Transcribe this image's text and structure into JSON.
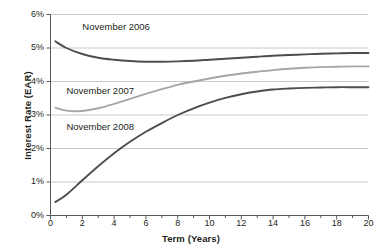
{
  "chart_data": {
    "type": "line",
    "title": "",
    "xlabel": "Term (Years)",
    "ylabel": "Interest Rate (EAR)",
    "xlim": [
      0,
      20
    ],
    "ylim": [
      0,
      6
    ],
    "xticks": [
      0,
      2,
      4,
      6,
      8,
      10,
      12,
      14,
      16,
      18,
      20
    ],
    "xtick_labels": [
      "0",
      "2",
      "4",
      "6",
      "8",
      "10",
      "12",
      "14",
      "16",
      "18",
      "20"
    ],
    "xminor_step": 1,
    "yticks": [
      0,
      1,
      2,
      3,
      4,
      5,
      6
    ],
    "ytick_labels": [
      "0%",
      "1%",
      "2%",
      "3%",
      "4%",
      "5%",
      "6%"
    ],
    "grid": "horizontal",
    "legend": "inline-annotations",
    "series": [
      {
        "name": "November 2006",
        "color": "#4d4d4d",
        "width": 1.9,
        "label_x": 2.0,
        "label_y": 5.55,
        "x": [
          0.3,
          1,
          2,
          3,
          4,
          5,
          6,
          7,
          8,
          9,
          10,
          11,
          12,
          13,
          14,
          15,
          16,
          17,
          18,
          19,
          20
        ],
        "y": [
          5.2,
          5.0,
          4.82,
          4.71,
          4.65,
          4.61,
          4.59,
          4.59,
          4.6,
          4.62,
          4.65,
          4.68,
          4.71,
          4.74,
          4.77,
          4.79,
          4.81,
          4.83,
          4.84,
          4.85,
          4.85
        ]
      },
      {
        "name": "November 2007",
        "color": "#a6a6a6",
        "width": 1.9,
        "label_x": 1.0,
        "label_y": 3.62,
        "x": [
          0.3,
          1,
          2,
          3,
          4,
          5,
          6,
          7,
          8,
          9,
          10,
          11,
          12,
          13,
          14,
          15,
          16,
          17,
          18,
          19,
          20
        ],
        "y": [
          3.22,
          3.13,
          3.12,
          3.2,
          3.33,
          3.48,
          3.63,
          3.77,
          3.9,
          4.0,
          4.09,
          4.17,
          4.24,
          4.29,
          4.34,
          4.38,
          4.41,
          4.43,
          4.44,
          4.45,
          4.45
        ]
      },
      {
        "name": "November 2008",
        "color": "#4d4d4d",
        "width": 1.9,
        "label_x": 1.0,
        "label_y": 2.55,
        "x": [
          0.3,
          1,
          2,
          3,
          4,
          5,
          6,
          7,
          8,
          9,
          10,
          11,
          12,
          13,
          14,
          15,
          16,
          17,
          18,
          19,
          20
        ],
        "y": [
          0.4,
          0.62,
          1.05,
          1.47,
          1.86,
          2.2,
          2.5,
          2.76,
          3.0,
          3.2,
          3.37,
          3.51,
          3.62,
          3.7,
          3.76,
          3.79,
          3.81,
          3.82,
          3.83,
          3.83,
          3.83
        ]
      }
    ]
  },
  "axes": {
    "ylabel": "Interest Rate (EAR)",
    "xlabel": "Term (Years)"
  },
  "style": {
    "grid_color": "#c9c9c9",
    "axis_color": "#58595b",
    "text_color": "#231f20",
    "background": "#ffffff"
  }
}
